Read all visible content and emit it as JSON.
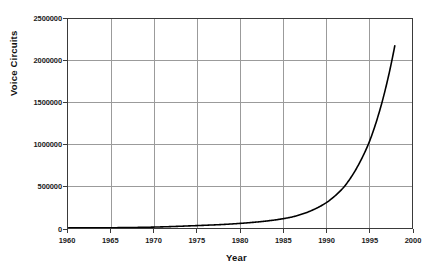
{
  "chart_data": {
    "type": "line",
    "title": "",
    "xlabel": "Year",
    "ylabel": "Voice Circuits",
    "xlim": [
      1960,
      2000
    ],
    "ylim": [
      0,
      2500000
    ],
    "grid": true,
    "legend": false,
    "legend_position": "none",
    "xticks": [
      1960,
      1965,
      1970,
      1975,
      1980,
      1985,
      1990,
      1995,
      2000
    ],
    "xtick_labels": [
      "1960",
      "1965",
      "1970",
      "1975",
      "1980",
      "1985",
      "1990",
      "1995",
      "2000"
    ],
    "yticks": [
      0,
      500000,
      1000000,
      1500000,
      2000000,
      2500000
    ],
    "ytick_labels": [
      "0",
      "500000",
      "1000000",
      "1500000",
      "2000000",
      "2500000"
    ],
    "series": [
      {
        "name": "Voice Circuits",
        "color": "#000000",
        "line_width": 1.6,
        "x": [
          1960,
          1962,
          1964,
          1966,
          1968,
          1970,
          1972,
          1974,
          1976,
          1978,
          1980,
          1982,
          1984,
          1986,
          1988,
          1990,
          1991,
          1992,
          1993,
          1994,
          1995,
          1996,
          1997,
          1998
        ],
        "values": [
          1000,
          1600,
          2600,
          4200,
          6800,
          11000,
          17000,
          25000,
          33000,
          42000,
          55000,
          72000,
          95000,
          130000,
          195000,
          300000,
          380000,
          480000,
          620000,
          800000,
          1020000,
          1320000,
          1700000,
          2180000
        ]
      }
    ]
  },
  "axis_style": {
    "grid_color": "#9a9a9a",
    "axis_color": "#3a3a3a",
    "text_color": "#1a1a1a",
    "background": "#ffffff"
  }
}
